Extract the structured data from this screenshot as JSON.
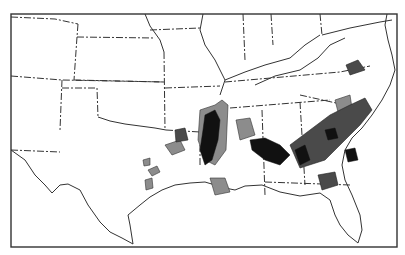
{
  "map": {
    "title": "",
    "subject": "Southern United States county shading map",
    "legend_levels": [
      {
        "level": "high",
        "color": "#111111"
      },
      {
        "level": "medium",
        "color": "#4a4a4a"
      },
      {
        "level": "low",
        "color": "#8c8c8c"
      }
    ],
    "regions_shaded": [
      "Mississippi River valley (Mississippi / Louisiana / Arkansas)",
      "Alabama black belt",
      "Georgia / South Carolina / North Carolina piedmont and coast",
      "East Texas",
      "North Florida",
      "Virginia tidewater"
    ]
  }
}
